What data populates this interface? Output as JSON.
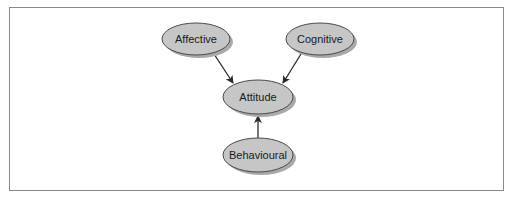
{
  "diagram": {
    "type": "concept-map",
    "colors": {
      "node_fill": "#c6c6c6",
      "node_stroke": "#4a4a4a",
      "node_shadow": "#a9a9a9",
      "edge": "#2a2a2a",
      "frame": "#8a8a8a"
    },
    "nodes": [
      {
        "id": "affective",
        "label": "Affective",
        "cx": 196,
        "cy": 39,
        "rx": 34,
        "ry": 16
      },
      {
        "id": "cognitive",
        "label": "Cognitive",
        "cx": 320,
        "cy": 39,
        "rx": 34,
        "ry": 16
      },
      {
        "id": "attitude",
        "label": "Attitude",
        "cx": 258,
        "cy": 97,
        "rx": 35,
        "ry": 17
      },
      {
        "id": "behavioural",
        "label": "Behavioural",
        "cx": 258,
        "cy": 155,
        "rx": 35,
        "ry": 17
      }
    ],
    "edges": [
      {
        "from": "affective",
        "to": "attitude"
      },
      {
        "from": "cognitive",
        "to": "attitude"
      },
      {
        "from": "behavioural",
        "to": "attitude"
      }
    ]
  }
}
